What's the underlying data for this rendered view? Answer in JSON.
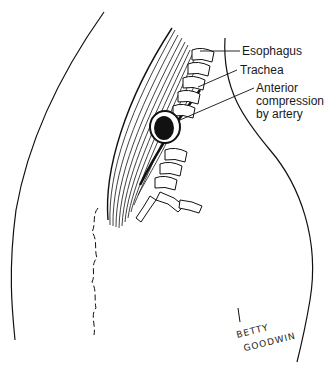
{
  "figure": {
    "type": "anatomical line illustration",
    "labels": [
      {
        "id": "esophagus",
        "text": "Esophagus"
      },
      {
        "id": "trachea",
        "text": "Trachea"
      },
      {
        "id": "anterior_compression_line1",
        "text": "Anterior"
      },
      {
        "id": "anterior_compression_line2",
        "text": "compression"
      },
      {
        "id": "anterior_compression_line3",
        "text": "by artery"
      }
    ],
    "signature": {
      "line1": "BETTY",
      "line2": "GOODWIN"
    }
  }
}
